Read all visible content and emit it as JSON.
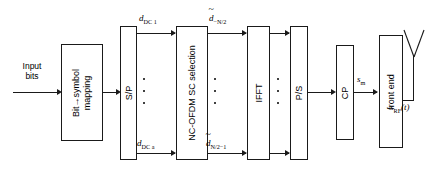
{
  "diagram": {
    "blocks": [
      {
        "id": "bit_symbol_mapping",
        "label_line1": "Bit→symbol",
        "label_line2": "mapping"
      },
      {
        "id": "sp",
        "label": "S/P"
      },
      {
        "id": "nc_ofdm_sc_selection",
        "label": "NC-OFDM SC selection"
      },
      {
        "id": "ifft",
        "label": "IFFT"
      },
      {
        "id": "ps",
        "label": "P/S"
      },
      {
        "id": "cp",
        "label": "CP"
      },
      {
        "id": "front_end",
        "label": "front end"
      }
    ],
    "input_label_line1": "Input",
    "input_label_line2": "bits",
    "signals": {
      "d_dc_1_sym": "d",
      "d_dc_1_sub": "DC 1",
      "d_dc_a_sym": "d",
      "d_dc_a_sub": "DC a",
      "d_neg_n2_sym": "d",
      "d_neg_n2_sub": "−N/2",
      "d_n2m1_sym": "d",
      "d_n2m1_sub": "N/2−1",
      "s_m_sym": "s",
      "s_m_sub": "m",
      "s_rf_sym": "s",
      "s_rf_sub": "RF",
      "s_rf_arg": "(t)"
    },
    "icons": {
      "antenna": "dipole-antenna-icon",
      "ellipsis": "vertical-ellipsis-icon"
    },
    "colors": {
      "line": "#1a1a1a",
      "background": "#ffffff"
    }
  }
}
